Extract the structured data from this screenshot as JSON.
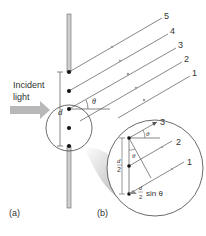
{
  "figure": {
    "incident_label_line1": "Incident",
    "incident_label_line2": "light",
    "slit_width_label": "d",
    "angle_label": "θ",
    "half_width_label_num": "d",
    "half_width_label_den": "2",
    "path_diff_label_num": "d",
    "path_diff_label_den": "2",
    "path_diff_label_suffix": "sin θ",
    "panel_a_label": "(a)",
    "panel_b_label": "(b)",
    "ray_labels": [
      "1",
      "2",
      "3",
      "4",
      "5"
    ],
    "zoom_ray_labels": [
      "1",
      "2",
      "3"
    ]
  },
  "colors": {
    "line": "#555555",
    "arrow_fill": "#b8b8b8",
    "barrier": "#bdbdbd",
    "text": "#333333"
  }
}
